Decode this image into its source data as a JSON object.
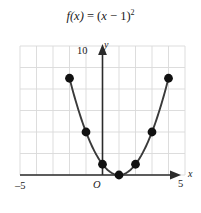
{
  "title": {
    "full": "f(x) = (x − 1)²",
    "fn": "f",
    "arg": "(x)",
    "eq": "= (",
    "var": "x",
    "minus": " − 1)",
    "exp": "2"
  },
  "labels": {
    "x_axis": "x",
    "y_axis": "y",
    "origin": "O",
    "x_min": "–5",
    "x_max": "5",
    "y_max": "10"
  },
  "colors": {
    "background": "#ffffff",
    "grid": "#d9d9d9",
    "axis": "#2b2b2b",
    "curve": "#3a3a3a",
    "point": "#111111",
    "text": "#1a1a1a"
  },
  "chart_data": {
    "type": "line",
    "xlabel": "x",
    "ylabel": "y",
    "xlim": [
      -5,
      5
    ],
    "ylim": [
      0,
      12
    ],
    "grid": true,
    "legend": null,
    "xticks": [
      -5,
      5
    ],
    "yticks": [
      10
    ],
    "xtick_labels": [
      "–5",
      "5"
    ],
    "ytick_labels": [
      "10"
    ],
    "series": [
      {
        "name": "f(x) = (x − 1)²",
        "x": [
          -2,
          -1,
          0,
          1,
          2,
          3,
          4
        ],
        "values": [
          9,
          4,
          1,
          0,
          1,
          4,
          9
        ],
        "marker": "filled-circle"
      }
    ],
    "annotations": [
      {
        "text": "O",
        "x": 0,
        "y": 0,
        "role": "origin-label"
      }
    ]
  }
}
